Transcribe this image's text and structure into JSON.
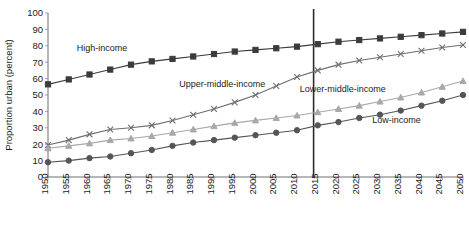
{
  "chart_data": {
    "type": "line",
    "title": "",
    "xlabel": "",
    "ylabel": "Proportion urban (percent)",
    "ylim": [
      0,
      100
    ],
    "ytick_step": 10,
    "grid": false,
    "legend_position": "inline-annotations",
    "x": [
      1950,
      1955,
      1960,
      1965,
      1970,
      1975,
      1980,
      1985,
      1990,
      1995,
      2000,
      2005,
      2010,
      2015,
      2020,
      2025,
      2030,
      2035,
      2040,
      2045,
      2050
    ],
    "ytick_labels": [
      "0",
      "10",
      "20",
      "30",
      "40",
      "50",
      "60",
      "70",
      "80",
      "90",
      "100"
    ],
    "xtick_labels": [
      "1950",
      "1955",
      "1960",
      "1965",
      "1970",
      "1975",
      "1980",
      "1985",
      "1990",
      "1995",
      "2000",
      "2005",
      "2010",
      "2015",
      "2020",
      "2025",
      "2030",
      "2035",
      "2040",
      "2045",
      "2050"
    ],
    "annotations": [
      {
        "text": "High-income",
        "x": 1963,
        "y": 77
      },
      {
        "text": "Upper-middle-income",
        "x": 1992,
        "y": 55
      },
      {
        "text": "Lower-middle-income",
        "x": 2021,
        "y": 52
      },
      {
        "text": "Low-income",
        "x": 2034,
        "y": 33
      }
    ],
    "reference_line": {
      "x": 2014,
      "label": ""
    },
    "series": [
      {
        "name": "High-income",
        "marker": "square",
        "color": "#3b3b3b",
        "values": [
          56.5,
          59.5,
          62.5,
          65.5,
          68.5,
          70.5,
          72.0,
          73.5,
          75.0,
          76.5,
          77.5,
          78.5,
          79.5,
          81.0,
          82.5,
          83.5,
          84.5,
          85.5,
          86.5,
          87.5,
          88.5
        ]
      },
      {
        "name": "Upper-middle-income",
        "marker": "cross",
        "color": "#6e6e6e",
        "values": [
          19.5,
          22.5,
          26.0,
          29.0,
          30.0,
          31.5,
          34.5,
          38.0,
          41.5,
          45.5,
          50.0,
          55.5,
          61.0,
          65.0,
          68.5,
          71.0,
          73.0,
          75.0,
          77.0,
          79.0,
          80.5
        ]
      },
      {
        "name": "Lower-middle-income",
        "marker": "triangle",
        "color": "#a8a8a8",
        "values": [
          17.5,
          19.0,
          20.5,
          22.5,
          23.5,
          25.0,
          27.0,
          29.0,
          31.0,
          33.0,
          34.5,
          36.0,
          37.5,
          39.5,
          41.5,
          43.5,
          46.0,
          48.5,
          51.5,
          55.0,
          58.5
        ]
      },
      {
        "name": "Low-income",
        "marker": "circle",
        "color": "#555555",
        "values": [
          9.0,
          10.0,
          11.5,
          12.5,
          14.5,
          16.5,
          19.0,
          21.0,
          22.5,
          24.0,
          25.5,
          27.0,
          28.5,
          31.5,
          33.5,
          36.0,
          38.0,
          40.5,
          43.5,
          46.5,
          50.0
        ]
      }
    ]
  }
}
